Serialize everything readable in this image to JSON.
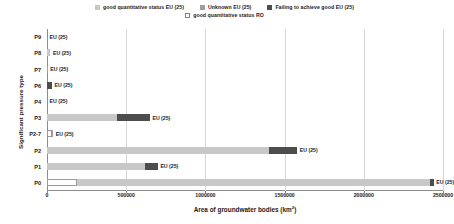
{
  "chart_data": {
    "type": "bar",
    "orientation": "horizontal",
    "stacked": true,
    "title": "",
    "xlabel": "Area of groundwater bodies (km2)",
    "ylabel": "Significant pressure type",
    "xlim": [
      0,
      2500000
    ],
    "xticks": [
      0,
      500000,
      1000000,
      1500000,
      2000000,
      2500000
    ],
    "xtick_labels": [
      "0",
      "500000",
      "1000000",
      "1500000",
      "2000000",
      "2500000"
    ],
    "grid": true,
    "legend_position": "top",
    "categories": [
      "P9",
      "P8",
      "P7",
      "P6",
      "P4",
      "P3",
      "P2-7",
      "P2",
      "P1",
      "P0"
    ],
    "series": [
      {
        "name": "good quantitative status EU (25)",
        "color": "#c8c8c8",
        "values": [
          0,
          22000,
          0,
          0,
          0,
          440000,
          0,
          1400000,
          620000,
          2230000
        ]
      },
      {
        "name": "Unknown EU (25)",
        "color": "#9e9e9e",
        "values": [
          0,
          0,
          5000,
          0,
          0,
          0,
          9000,
          0,
          0,
          0
        ]
      },
      {
        "name": "Failing to achieve good  EU (25)",
        "color": "#4d4d4d",
        "values": [
          0,
          0,
          0,
          32000,
          0,
          210000,
          0,
          180000,
          80000,
          22000
        ]
      },
      {
        "name": "good quantitative status RO",
        "color": "#ffffff",
        "values": [
          0,
          0,
          0,
          0,
          0,
          0,
          0,
          0,
          0,
          0
        ]
      }
    ],
    "bar_end_labels": [
      "EU (25)",
      "EU (25)",
      "EU (25)",
      "EU (25)",
      "EU (25)",
      "EU (25)",
      "EU (25)",
      "EU (25)",
      "EU (25)",
      "EU (25)"
    ],
    "ro_markers": [
      {
        "category": "P2-7",
        "value": 30000,
        "label": ""
      },
      {
        "category": "P0",
        "value": 190000,
        "label": ""
      }
    ]
  },
  "legend": {
    "row1": [
      {
        "label": "good quantitative status EU (25)",
        "color": "#c8c8c8"
      },
      {
        "label": "Unknown EU (25)",
        "color": "#9e9e9e"
      },
      {
        "label": "Failing to achieve good  EU (25)",
        "color": "#4d4d4d"
      }
    ],
    "row2": [
      {
        "label": "good quantitative status RO",
        "color": "#ffffff"
      }
    ]
  },
  "axes": {
    "x_title": "Area of groundwater bodies (km2)",
    "y_title": "Significant pressure type"
  }
}
